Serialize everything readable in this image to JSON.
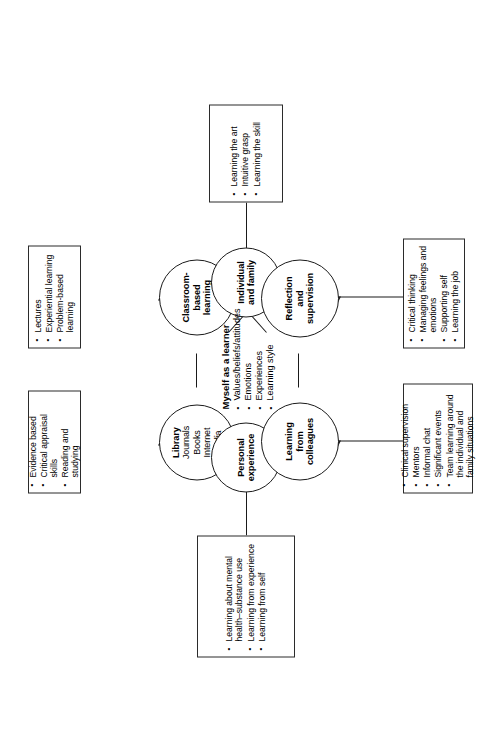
{
  "figure": {
    "center": {
      "title": "Myself as a learner",
      "bullets": [
        "Values/beliefs/attitudes",
        "Emotions",
        "Experiences",
        "Learning style"
      ]
    },
    "nodes": {
      "library": {
        "title": "Library",
        "items": [
          "Journals",
          "Books",
          "Internet",
          "Media"
        ]
      },
      "classroom": {
        "title": "Classroom-based learning"
      },
      "personal_experience": {
        "title": "Personal experience"
      },
      "individual_family": {
        "title": "Individual and family"
      },
      "learning_from_colleagues": {
        "title": "Learning from colleagues"
      },
      "reflection_supervision": {
        "title": "Reflection and supervision"
      }
    },
    "boxes": {
      "library_box": {
        "bullets": [
          "Evidence based",
          "Critical appraisal skills",
          "Reading and studying"
        ]
      },
      "classroom_box": {
        "bullets": [
          "Lectures",
          "Experiential learning",
          "Problem-based learning"
        ]
      },
      "personal_experience_box": {
        "bullets": [
          "Learning about mental health–substance use",
          "Learning from experience",
          "Learning from self"
        ]
      },
      "individual_family_box": {
        "bullets": [
          "Learning the art",
          "Intuitive grasp",
          "Learning the skill"
        ]
      },
      "colleagues_box": {
        "bullets": [
          "Clinical supervision",
          "Mentors",
          "Informal chat",
          "Significant events",
          "Team learning around the individual and family situations"
        ]
      },
      "reflection_box": {
        "bullets": [
          "Critical thinking",
          "Managing feelings and emotions",
          "Supporting self",
          "Learning the job"
        ]
      }
    }
  }
}
